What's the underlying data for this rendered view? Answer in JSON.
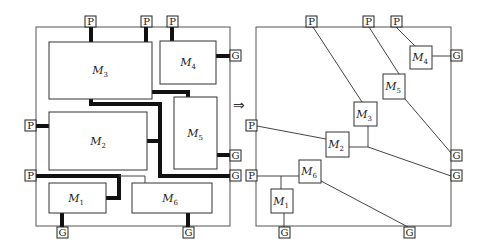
{
  "diagram": {
    "arrow": "⇒",
    "pin_labels": {
      "power": "P",
      "ground": "G"
    },
    "left_panel": {
      "modules": [
        {
          "name": "M",
          "sub": "3"
        },
        {
          "name": "M",
          "sub": "4"
        },
        {
          "name": "M",
          "sub": "2"
        },
        {
          "name": "M",
          "sub": "5"
        },
        {
          "name": "M",
          "sub": "1"
        },
        {
          "name": "M",
          "sub": "6"
        }
      ]
    },
    "right_panel": {
      "modules": [
        {
          "name": "M",
          "sub": "4"
        },
        {
          "name": "M",
          "sub": "5"
        },
        {
          "name": "M",
          "sub": "3"
        },
        {
          "name": "M",
          "sub": "2"
        },
        {
          "name": "M",
          "sub": "6"
        },
        {
          "name": "M",
          "sub": "1"
        }
      ]
    }
  }
}
